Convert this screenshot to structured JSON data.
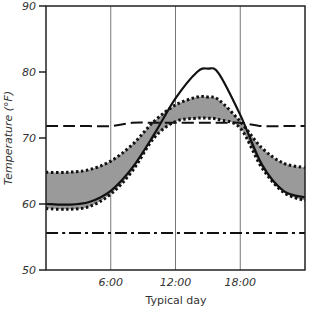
{
  "chart_data": {
    "type": "line",
    "title": "",
    "xlabel": "Typical day",
    "ylabel": "Temperature (°F)",
    "xlim": [
      0,
      24
    ],
    "ylim": [
      50,
      90
    ],
    "x_ticks": [
      6,
      12,
      18
    ],
    "x_tick_labels": [
      "6:00",
      "12:00",
      "18:00"
    ],
    "y_ticks": [
      50,
      60,
      70,
      80,
      90
    ],
    "y_tick_labels": [
      "50",
      "60",
      "70",
      "80",
      "90"
    ],
    "grid": "vertical lines at 6:00, 12:00, 18:00",
    "legend": "none",
    "x": [
      0,
      2,
      4,
      6,
      8,
      10,
      12,
      14,
      15,
      16,
      18,
      20,
      22,
      24
    ],
    "series": [
      {
        "name": "solid curve",
        "style": "solid",
        "values": [
          60.0,
          59.9,
          60.3,
          62.0,
          65.5,
          70.5,
          76.0,
          80.0,
          80.5,
          79.8,
          73.5,
          66.0,
          62.0,
          61.0
        ]
      },
      {
        "name": "dashed line",
        "style": "dashed",
        "values": [
          71.8,
          71.8,
          71.8,
          71.8,
          72.3,
          72.3,
          72.3,
          72.3,
          72.3,
          72.3,
          72.3,
          71.8,
          71.8,
          71.8
        ]
      },
      {
        "name": "dash-dot line",
        "style": "dash-dot",
        "values": [
          55.6,
          55.6,
          55.6,
          55.6,
          55.6,
          55.6,
          55.6,
          55.6,
          55.6,
          55.6,
          55.6,
          55.6,
          55.6,
          55.6
        ]
      },
      {
        "name": "upper dotted bound",
        "style": "dotted",
        "values": [
          64.8,
          64.8,
          65.2,
          66.5,
          69.0,
          72.5,
          75.0,
          76.2,
          76.2,
          75.8,
          72.5,
          68.5,
          66.2,
          65.5
        ]
      },
      {
        "name": "lower dotted bound",
        "style": "dotted",
        "values": [
          59.3,
          59.2,
          59.6,
          61.5,
          65.0,
          70.0,
          72.5,
          73.0,
          73.0,
          72.8,
          71.5,
          65.5,
          61.8,
          60.5
        ]
      }
    ],
    "shaded_band": "gray fill between upper and lower dotted bounds"
  }
}
